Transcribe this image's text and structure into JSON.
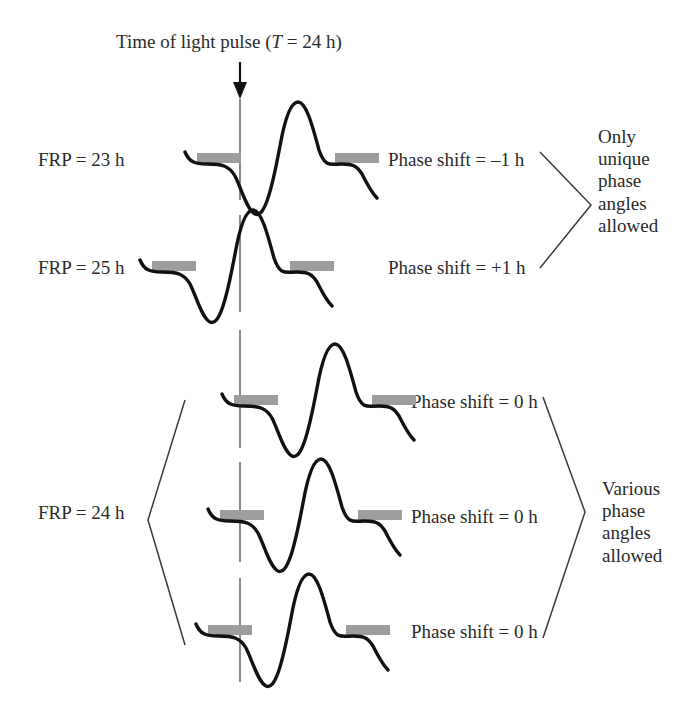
{
  "figure": {
    "title_prefix": "Time of light pulse (",
    "title_var": "T",
    "title_suffix": " = 24 h)",
    "background": "#ffffff",
    "wave_color": "#111111",
    "bar_color": "#9d9d9d",
    "reference_line_color": "#6b6b6b",
    "reference_line_x": 240
  },
  "groups": [
    {
      "name": "unique-phase-group",
      "note": [
        "Only",
        "unique",
        "phase",
        "angles",
        "allowed"
      ],
      "rows": [
        {
          "frp_label": "FRP = 23 h",
          "phase_label": "Phase shift = –1 h",
          "phase_shift_hours": -1,
          "free_running_period_hours": 23,
          "wave_offset_x": 185,
          "baseline_y": 164
        },
        {
          "frp_label": "FRP = 25 h",
          "phase_label": "Phase shift = +1 h",
          "phase_shift_hours": 1,
          "free_running_period_hours": 25,
          "wave_offset_x": 140,
          "baseline_y": 272
        }
      ]
    },
    {
      "name": "various-phase-group",
      "note": [
        "Various",
        "phase",
        "angles",
        "allowed"
      ],
      "frp_label": "FRP = 24 h",
      "free_running_period_hours": 24,
      "rows": [
        {
          "phase_label": "Phase shift = 0 h",
          "phase_shift_hours": 0,
          "wave_offset_x": 222,
          "baseline_y": 406
        },
        {
          "phase_label": "Phase shift = 0 h",
          "phase_shift_hours": 0,
          "wave_offset_x": 208,
          "baseline_y": 521
        },
        {
          "phase_label": "Phase shift = 0 h",
          "phase_shift_hours": 0,
          "wave_offset_x": 196,
          "baseline_y": 636
        }
      ]
    }
  ],
  "chart_data": {
    "type": "line",
    "title": "Time of light pulse (T = 24 h)",
    "xlabel": "",
    "ylabel": "",
    "annotations": [
      "FRP = 23 h",
      "FRP = 25 h",
      "FRP = 24 h",
      "Phase shift = –1 h",
      "Phase shift = +1 h",
      "Phase shift = 0 h",
      "Only unique phase angles allowed",
      "Various phase angles allowed"
    ],
    "series": [
      {
        "name": "FRP = 23 h",
        "phase_shift_h": -1,
        "offset_x_px": 185
      },
      {
        "name": "FRP = 25 h",
        "phase_shift_h": 1,
        "offset_x_px": 140
      },
      {
        "name": "FRP = 24 h (a)",
        "phase_shift_h": 0,
        "offset_x_px": 222
      },
      {
        "name": "FRP = 24 h (b)",
        "phase_shift_h": 0,
        "offset_x_px": 208
      },
      {
        "name": "FRP = 24 h (c)",
        "phase_shift_h": 0,
        "offset_x_px": 196
      }
    ],
    "waveform_shape": "flat plateau, trough, tall peak, descent to second plateau, tail down",
    "grid": false,
    "legend": "none"
  }
}
